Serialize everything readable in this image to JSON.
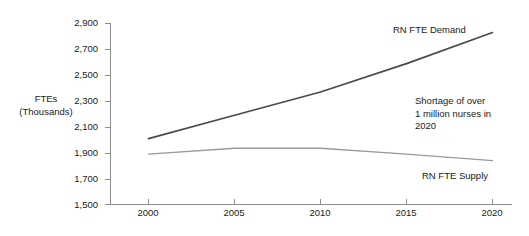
{
  "chart_data": {
    "type": "line",
    "title": "",
    "subtitle": "",
    "xlabel": "",
    "ylabel": "FTEs (Thousands)",
    "ylabel_line1": "FTEs",
    "ylabel_line2": "(Thousands)",
    "grid": false,
    "legend_position": "inline-annotations",
    "x": [
      2000,
      2005,
      2010,
      2015,
      2020
    ],
    "xlim": [
      2000,
      2020
    ],
    "ylim": [
      1500,
      2900
    ],
    "xticks": [
      "2000",
      "2005",
      "2010",
      "2015",
      "2020"
    ],
    "yticks": [
      "1,500",
      "1,700",
      "1,900",
      "2,100",
      "2,300",
      "2,500",
      "2,700",
      "2,900"
    ],
    "ytick_values": [
      1500,
      1700,
      1900,
      2100,
      2300,
      2500,
      2700,
      2900
    ],
    "series": [
      {
        "name": "RN FTE Demand",
        "color": "#4a4a4a",
        "width": 1.7,
        "values": [
          2010,
          2190,
          2370,
          2590,
          2830
        ]
      },
      {
        "name": "RN FTE Supply",
        "color": "#9a9a9a",
        "width": 1.3,
        "values": [
          1890,
          1935,
          1935,
          1890,
          1840
        ]
      }
    ],
    "annotations": [
      {
        "id": "demand",
        "text": "RN FTE Demand"
      },
      {
        "id": "shortage",
        "line1": "Shortage of over",
        "line2": "1 million nurses in",
        "line3": "2020"
      },
      {
        "id": "supply",
        "text": "RN FTE Supply"
      }
    ],
    "axis_color": "#8c8c8c"
  },
  "axis": {
    "title_line1": "FTEs",
    "title_line2": "(Thousands)"
  },
  "yticks": {
    "t0": "2,900",
    "t1": "2,700",
    "t2": "2,500",
    "t3": "2,300",
    "t4": "2,100",
    "t5": "1,900",
    "t6": "1,700",
    "t7": "1,500"
  },
  "xticks": {
    "t0": "2000",
    "t1": "2005",
    "t2": "2010",
    "t3": "2015",
    "t4": "2020"
  },
  "annotations": {
    "demand_label": "RN FTE Demand",
    "supply_label": "RN FTE Supply",
    "shortage_line1": "Shortage of over",
    "shortage_line2": "1 million nurses in",
    "shortage_line3": "2020"
  }
}
